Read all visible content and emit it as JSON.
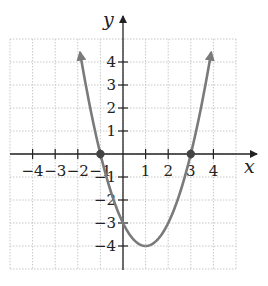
{
  "chart_data": {
    "type": "line",
    "title": "",
    "xlabel": "x",
    "ylabel": "y",
    "xlim": [
      -5,
      5
    ],
    "ylim": [
      -5,
      5
    ],
    "grid": true,
    "grid_style": "dotted",
    "x_ticks": [
      -4,
      -3,
      -2,
      -1,
      1,
      2,
      3,
      4
    ],
    "y_ticks": [
      -4,
      -3,
      -2,
      -1,
      1,
      2,
      3,
      4
    ],
    "x_tick_labels": [
      "−4",
      "−3",
      "−2",
      "−1",
      "1",
      "2",
      "3",
      "4"
    ],
    "y_tick_labels": [
      "−4",
      "−3",
      "−2",
      "−1",
      "1",
      "2",
      "3",
      "4"
    ],
    "series": [
      {
        "name": "y = x^2 - 2x - 3",
        "color": "#7a7a7a",
        "x_range": [
          -1.9,
          3.9
        ],
        "arrows_at_ends": true,
        "vertex": [
          1,
          -4
        ],
        "y_intercept": [
          0,
          -3
        ]
      }
    ],
    "points": [
      {
        "x": -1,
        "y": 0,
        "label": "x-intercept"
      },
      {
        "x": 3,
        "y": 0,
        "label": "x-intercept"
      }
    ],
    "legend": null
  },
  "labels": {
    "x_axis": "x",
    "y_axis": "y"
  }
}
